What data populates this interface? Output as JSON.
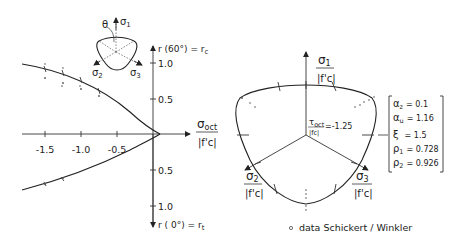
{
  "left_plot": {
    "x_axis_label_num": "σ",
    "x_axis_label_sub": "oct",
    "x_axis_label_den": "|f'c|",
    "x_ticks": [
      "-1.5",
      "-1.0",
      "-0.5"
    ],
    "y_up_label": "r (60°) = r",
    "y_up_sub": "c",
    "y_down_label": "r ( 0°) = r",
    "y_down_sub": "t",
    "y_up_ticks": [
      "1.0",
      "0.5"
    ],
    "y_down_ticks": [
      "0.5",
      "1.0"
    ],
    "inset": {
      "theta": "θ",
      "s1": "σ",
      "s1_sub": "1",
      "s2": "σ",
      "s2_sub": "2",
      "s3": "σ",
      "s3_sub": "3"
    }
  },
  "right_plot": {
    "s1_num": "σ",
    "s1_sub": "1",
    "s1_den": "|f'c|",
    "s2_num": "σ",
    "s2_sub": "2",
    "s2_den": "|f'c|",
    "s3_num": "σ",
    "s3_sub": "3",
    "s3_den": "|f'c|",
    "tau_num": "τ",
    "tau_sub": "oct",
    "tau_den": "|fc|",
    "tau_value": "=-1.25"
  },
  "parameters": [
    {
      "sym": "α",
      "sub": "z",
      "value": "= 0.1"
    },
    {
      "sym": "α",
      "sub": "u",
      "value": "= 1.16"
    },
    {
      "sym": "ξ",
      "sub": "",
      "value": "= 1.5"
    },
    {
      "sym": "ρ",
      "sub": "1",
      "value": "= 0.728"
    },
    {
      "sym": "ρ",
      "sub": "2",
      "value": "= 0.926"
    }
  ],
  "legend": {
    "marker": "∘",
    "text": "data  Schickert / Winkler"
  }
}
